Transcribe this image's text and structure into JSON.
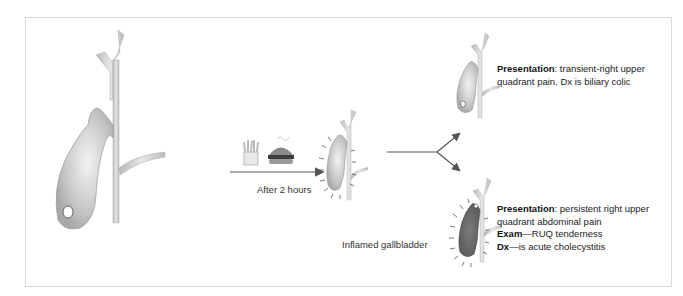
{
  "figure": {
    "arrow_label": "After 2 hours",
    "food_icons": [
      "french-fries-icon",
      "hamburger-icon"
    ],
    "inflamed_label": "Inflamed gallbladder",
    "outcome_top": {
      "presentation_label": "Presentation",
      "presentation_text": ": transient-right upper quadrant pain. Dx is biliary colic"
    },
    "outcome_bottom": {
      "presentation_label": "Presentation",
      "presentation_text": ": persistent right upper quadrant abdominal pain",
      "exam_label": "Exam",
      "exam_text": "—RUQ tenderness",
      "dx_label": "Dx",
      "dx_text": "—is acute cholecystitis"
    },
    "colors": {
      "duct": "#cfcfcf",
      "gallbladder_normal": "#c8c8c8",
      "gallbladder_inflamed": "#6e6e6e",
      "arrow": "#555555",
      "frame": "#d9d9d9"
    }
  }
}
